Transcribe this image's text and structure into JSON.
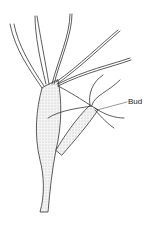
{
  "diagram": {
    "labels": [
      {
        "id": "bud",
        "text": "Bud"
      }
    ]
  }
}
